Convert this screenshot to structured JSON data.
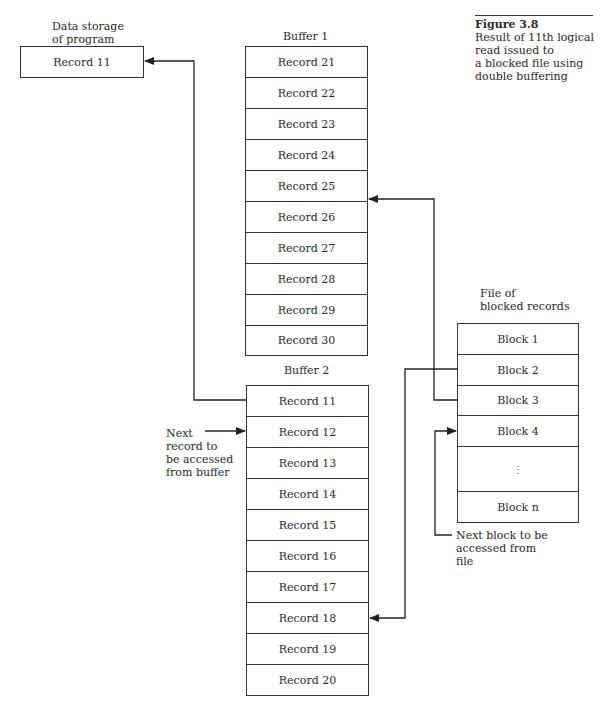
{
  "caption": {
    "figure_number": "Figure 3.8",
    "lines": [
      "Result of 11th logical",
      "read issued to",
      "a blocked file using",
      "double buffering"
    ]
  },
  "program_storage": {
    "label_lines": [
      "Data storage",
      "of program"
    ],
    "record": "Record 11"
  },
  "buffer1": {
    "label": "Buffer 1",
    "records": [
      "Record 21",
      "Record 22",
      "Record 23",
      "Record 24",
      "Record 25",
      "Record 26",
      "Record 27",
      "Record 28",
      "Record 29",
      "Record 30"
    ]
  },
  "buffer2": {
    "label": "Buffer 2",
    "records": [
      "Record 11",
      "Record 12",
      "Record 13",
      "Record 14",
      "Record 15",
      "Record 16",
      "Record 17",
      "Record 18",
      "Record 19",
      "Record 20"
    ]
  },
  "file": {
    "label_lines": [
      "File of",
      "blocked records"
    ],
    "blocks": [
      "Block 1",
      "Block 2",
      "Block 3",
      "Block 4",
      "⋮",
      "Block n"
    ]
  },
  "annotations": {
    "next_record_lines": [
      "Next",
      "record to",
      "be accessed",
      "from buffer"
    ],
    "next_block_lines": [
      "Next block to be",
      "accessed from",
      "file"
    ]
  },
  "colors": {
    "line": "#222222",
    "text": "#2a2a2a",
    "background": "#ffffff"
  }
}
